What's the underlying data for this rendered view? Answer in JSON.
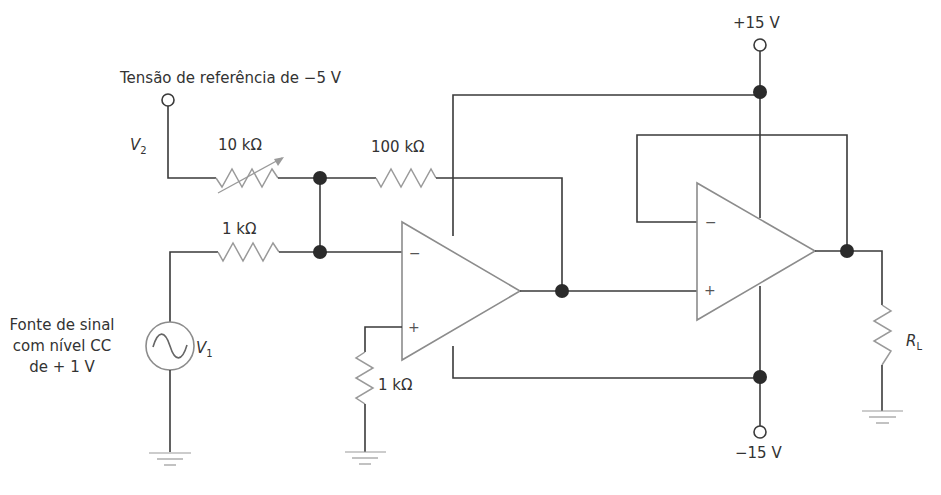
{
  "diagram": {
    "type": "circuit-schematic",
    "labels": {
      "reference_voltage": "Tensão de referência de −5 V",
      "v2": "V",
      "v2_sub": "2",
      "v1": "V",
      "v1_sub": "1",
      "r_variable": "10 kΩ",
      "r_feedback": "100 kΩ",
      "r_input": "1 kΩ",
      "r_ground": "1 kΩ",
      "rl": "R",
      "rl_sub": "L",
      "vplus": "+15 V",
      "vminus": "−15 V",
      "source_line1": "Fonte de sinal",
      "source_line2": "com nível CC",
      "source_line3": "de + 1 V"
    },
    "opamps": [
      {
        "id": "opamp-1",
        "inverting": "−",
        "noninverting": "+"
      },
      {
        "id": "opamp-2",
        "inverting": "−",
        "noninverting": "+"
      }
    ],
    "colors": {
      "wire": "#3a3a3a",
      "resistor": "#9a9a9a",
      "opamp_outline": "#8c8c8c",
      "junction": "#2b2b2b",
      "text": "#333333"
    }
  }
}
